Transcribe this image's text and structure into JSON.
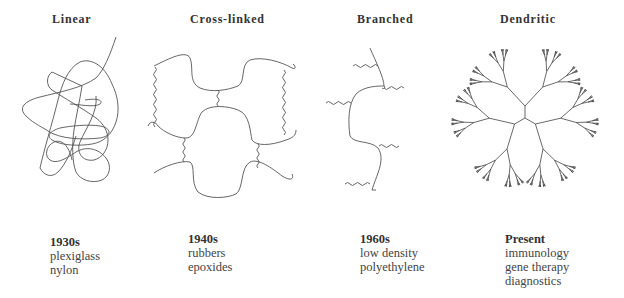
{
  "panels": [
    {
      "title": "Linear",
      "era": "1930s",
      "examples": [
        "plexiglass",
        "nylon"
      ]
    },
    {
      "title": "Cross-linked",
      "era": "1940s",
      "examples": [
        "rubbers",
        "epoxides"
      ]
    },
    {
      "title": "Branched",
      "era": "1960s",
      "examples": [
        "low density",
        "polyethylene"
      ]
    },
    {
      "title": "Dendritic",
      "era": "Present",
      "examples": [
        "immunology",
        "gene therapy",
        "diagnostics"
      ]
    }
  ],
  "colors": {
    "background": "#ffffff",
    "line": "#555555",
    "text": "#333333"
  }
}
